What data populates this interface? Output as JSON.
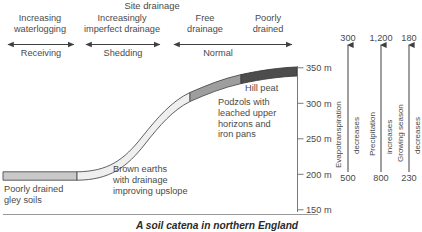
{
  "figure": {
    "caption": "A soil catena in northern England",
    "top_title": "Site drainage"
  },
  "drainage_classes": [
    {
      "label": "Increasing\nwaterlogging",
      "cx": 40,
      "y": 13
    },
    {
      "label": "Increasingly\nimperfect drainage",
      "cx": 122,
      "y": 13
    },
    {
      "label": "Free\ndrainage",
      "cx": 205,
      "y": 13
    },
    {
      "label": "Poorly\ndrained",
      "cx": 268,
      "y": 13
    }
  ],
  "process_zones": [
    {
      "label": "Receiving",
      "x1": 4,
      "x2": 78,
      "cx": 41,
      "y": 49
    },
    {
      "label": "Shedding",
      "x1": 82,
      "x2": 164,
      "cx": 123,
      "y": 49
    },
    {
      "label": "Normal",
      "x1": 170,
      "x2": 296,
      "cx": 218,
      "y": 49
    }
  ],
  "elevation_axis": {
    "unit": "m",
    "ticks": [
      {
        "value": "350 m",
        "y": 68
      },
      {
        "value": "300 m",
        "y": 103
      },
      {
        "value": "250 m",
        "y": 139
      },
      {
        "value": "200 m",
        "y": 174
      },
      {
        "value": "150 m",
        "y": 210
      }
    ]
  },
  "soil_bands": [
    {
      "name": "gley",
      "label": "Poorly drained\ngley soils",
      "color": "#c9c9c9",
      "label_x": 4,
      "label_y": 185
    },
    {
      "name": "brown-earths",
      "label": "Brown earths\nwith drainage\nimproving upslope",
      "color": "#efefef",
      "label_x": 113,
      "label_y": 165
    },
    {
      "name": "podzols",
      "label": "Podzols with\nleached upper\nhorizons and\niron pans",
      "color": "#9e9e9e",
      "label_x": 218,
      "label_y": 98
    },
    {
      "name": "hill-peat",
      "label": "Hill peat",
      "color": "#4d4d4d",
      "label_x": 245,
      "label_y": 84
    }
  ],
  "climate_axes": [
    {
      "name": "evapotranspiration",
      "variable": "Evapotranspiration",
      "trend": "decreases",
      "top_value": "300",
      "bottom_value": "500",
      "x": 348
    },
    {
      "name": "precipitation",
      "variable": "Precipitation",
      "trend": "increases",
      "top_value": "1,200",
      "bottom_value": "800",
      "x": 381
    },
    {
      "name": "growing-season",
      "variable": "Growing season",
      "trend": "decreases",
      "top_value": "180",
      "bottom_value": "230",
      "x": 409
    }
  ],
  "colors": {
    "ink": "#4a4a4a",
    "line": "#555555",
    "caption": "#2a2a2a"
  }
}
